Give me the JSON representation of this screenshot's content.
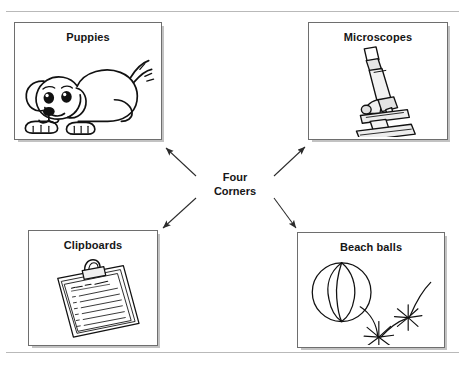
{
  "document": {
    "clipped_header_text": "· · · · · · · · · · · · · · · · · · · · · · · · ·",
    "rule_color": "#b9b9b9"
  },
  "diagram": {
    "type": "four-corners-radial",
    "center": {
      "line1": "Four",
      "line2": "Corners"
    },
    "arrow_color": "#2b2b2b",
    "box_border_color": "#6e6e6e",
    "shadow_color": "#c2c2c2",
    "nodes": [
      {
        "id": "puppies",
        "label": "Puppies",
        "position": "top-left",
        "art": "puppy-illustration"
      },
      {
        "id": "microscopes",
        "label": "Microscopes",
        "position": "top-right",
        "art": "microscope-illustration"
      },
      {
        "id": "clipboards",
        "label": "Clipboards",
        "position": "bottom-left",
        "art": "clipboard-illustration",
        "art_text": "To Do List"
      },
      {
        "id": "beachballs",
        "label": "Beach balls",
        "position": "bottom-right",
        "art": "beach-ball-illustration"
      }
    ]
  }
}
